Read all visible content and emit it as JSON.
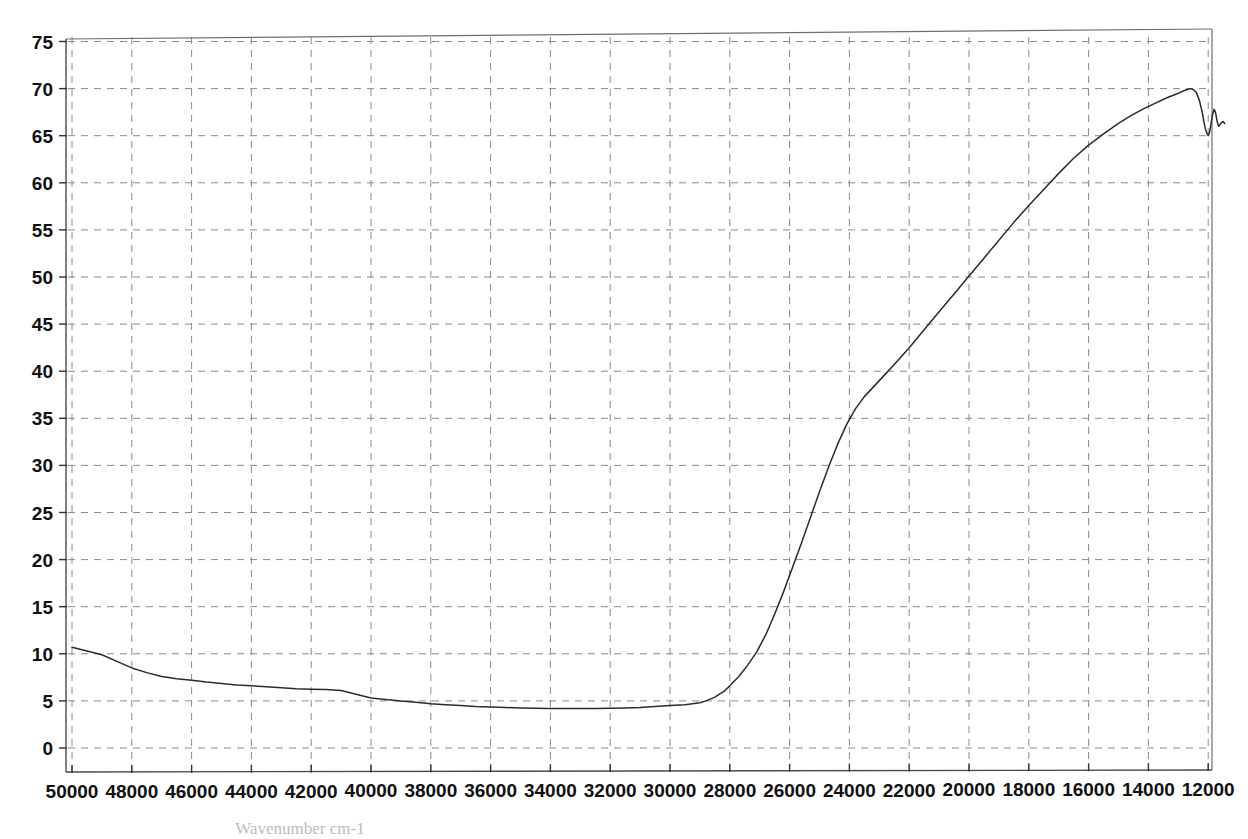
{
  "chart_data": {
    "type": "line",
    "title": "",
    "subtitle": "",
    "xlabel": "Wavenumber cm-1",
    "ylabel": "",
    "xlim": [
      50000,
      11400
    ],
    "ylim": [
      0,
      76
    ],
    "x_reversed": true,
    "grid": true,
    "legend": null,
    "legend_position": "none",
    "x_ticks": [
      50000,
      48000,
      46000,
      44000,
      42000,
      40000,
      38000,
      36000,
      34000,
      32000,
      30000,
      28000,
      26000,
      24000,
      22000,
      20000,
      18000,
      16000,
      14000,
      12000
    ],
    "x_tick_labels": [
      "50000",
      "48000",
      "46000",
      "44000",
      "42000",
      "40000",
      "38000",
      "36000",
      "34000",
      "32000",
      "30000",
      "28000",
      "26000",
      "24000",
      "22000",
      "20000",
      "18000",
      "16000",
      "14000",
      "12000"
    ],
    "y_ticks": [
      0,
      5,
      10,
      15,
      20,
      25,
      30,
      35,
      40,
      45,
      50,
      55,
      60,
      65,
      70,
      75
    ],
    "y_tick_labels": [
      "0",
      "5",
      "10",
      "15",
      "20",
      "25",
      "30",
      "35",
      "40",
      "45",
      "50",
      "55",
      "60",
      "65",
      "70",
      "75"
    ],
    "series": [
      {
        "name": "transmittance",
        "color": "#2b2b2b",
        "x": [
          50000,
          49500,
          49000,
          48500,
          48000,
          47500,
          47000,
          46500,
          46000,
          45500,
          45000,
          44500,
          44000,
          43500,
          43000,
          42500,
          42000,
          41500,
          41000,
          40500,
          40000,
          39500,
          39000,
          38500,
          38000,
          37500,
          37000,
          36500,
          36000,
          35500,
          35000,
          34500,
          34000,
          33500,
          33000,
          32500,
          32000,
          31500,
          31000,
          30500,
          30000,
          29500,
          29000,
          28800,
          28500,
          28200,
          28000,
          27700,
          27400,
          27100,
          26800,
          26500,
          26200,
          25900,
          25600,
          25300,
          25000,
          24700,
          24400,
          24100,
          23800,
          23500,
          23000,
          22500,
          22000,
          21500,
          21000,
          20500,
          20000,
          19500,
          19000,
          18500,
          18000,
          17500,
          17000,
          16500,
          16000,
          15500,
          15000,
          14600,
          14200,
          13800,
          13400,
          13000,
          12800,
          12700,
          12600,
          12500,
          12400,
          12300,
          12200,
          12150,
          12100,
          12050,
          12000,
          11950,
          11900,
          11850,
          11800,
          11750,
          11700,
          11650,
          11600,
          11550,
          11500,
          11450
        ],
        "y": [
          10.7,
          10.3,
          9.9,
          9.2,
          8.5,
          8.0,
          7.6,
          7.35,
          7.2,
          7.0,
          6.85,
          6.7,
          6.6,
          6.5,
          6.4,
          6.3,
          6.25,
          6.2,
          6.1,
          5.7,
          5.3,
          5.15,
          5.0,
          4.85,
          4.7,
          4.6,
          4.5,
          4.4,
          4.35,
          4.3,
          4.25,
          4.22,
          4.2,
          4.2,
          4.2,
          4.2,
          4.22,
          4.25,
          4.3,
          4.4,
          4.5,
          4.6,
          4.8,
          5.0,
          5.4,
          6.0,
          6.6,
          7.6,
          8.8,
          10.2,
          12.0,
          14.2,
          16.6,
          19.2,
          21.8,
          24.5,
          27.2,
          29.8,
          32.2,
          34.3,
          36.0,
          37.3,
          39.0,
          40.7,
          42.5,
          44.4,
          46.3,
          48.2,
          50.1,
          52.0,
          53.9,
          55.8,
          57.6,
          59.3,
          61.0,
          62.6,
          64.0,
          65.2,
          66.3,
          67.1,
          67.8,
          68.4,
          69.0,
          69.5,
          69.8,
          69.9,
          70.0,
          69.9,
          69.6,
          68.8,
          67.5,
          66.6,
          65.8,
          65.3,
          65.0,
          65.4,
          66.4,
          67.3,
          67.8,
          67.4,
          66.5,
          66.0,
          66.2,
          66.4,
          66.5,
          66.3
        ]
      }
    ],
    "annotations": []
  },
  "layout": {
    "plot_left_px": 66,
    "plot_right_px": 1208,
    "plot_top_px": 33,
    "plot_bottom_px": 772,
    "grid_x0_px": 72,
    "grid_x_step_px": 59.8,
    "grid_y0_px": 748,
    "grid_y_step_px": 47.1
  }
}
